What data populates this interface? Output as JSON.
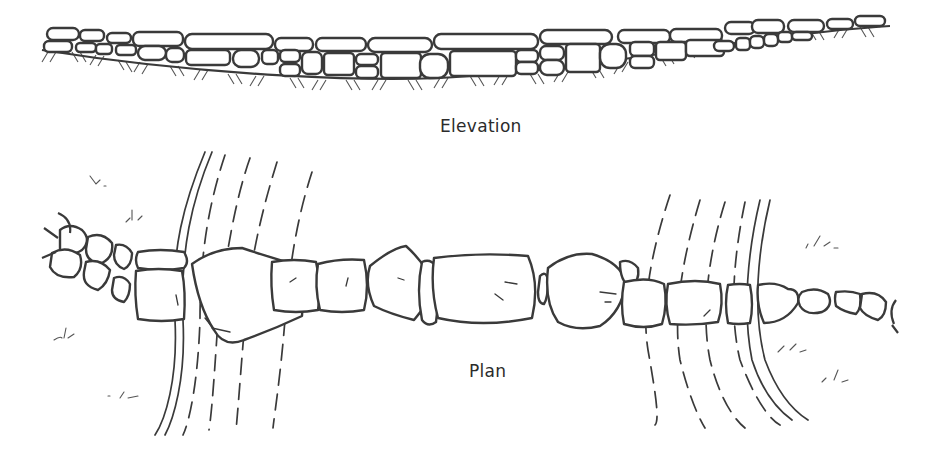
{
  "diagram": {
    "views": [
      {
        "id": "elevation",
        "label": "Elevation"
      },
      {
        "id": "plan",
        "label": "Plan"
      }
    ],
    "labels": {
      "elevation": "Elevation",
      "plan": "Plan"
    },
    "colors": {
      "line": "#3a3a3a",
      "background": "#ffffff"
    }
  }
}
